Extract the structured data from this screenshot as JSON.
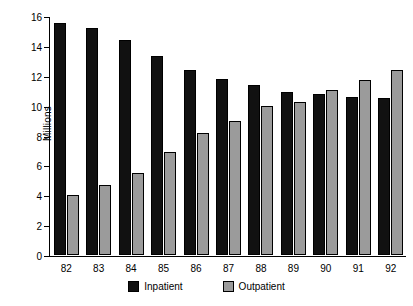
{
  "chart_data": {
    "type": "bar",
    "title": "",
    "xlabel": "",
    "ylabel": "Millions",
    "ylim": [
      0,
      16
    ],
    "yticks": [
      0,
      2,
      4,
      6,
      8,
      10,
      12,
      14,
      16
    ],
    "grid": false,
    "legend_position": "bottom",
    "categories": [
      "82",
      "83",
      "84",
      "85",
      "86",
      "87",
      "88",
      "89",
      "90",
      "91",
      "92"
    ],
    "series": [
      {
        "name": "Inpatient",
        "color": "#111111",
        "values": [
          15.5,
          15.2,
          14.4,
          13.3,
          12.4,
          11.8,
          11.4,
          10.9,
          10.8,
          10.6,
          10.5
        ]
      },
      {
        "name": "Outpatient",
        "color": "#9b9b9b",
        "values": [
          4.0,
          4.7,
          5.5,
          6.9,
          8.2,
          9.0,
          10.0,
          10.25,
          11.05,
          11.7,
          12.4
        ]
      }
    ]
  },
  "axes": {
    "y_title": "Millions",
    "y_tick_labels": [
      "0",
      "2",
      "4",
      "6",
      "8",
      "10",
      "12",
      "14",
      "16"
    ],
    "x_tick_labels": [
      "82",
      "83",
      "84",
      "85",
      "86",
      "87",
      "88",
      "89",
      "90",
      "91",
      "92"
    ]
  },
  "legend": {
    "entries": [
      {
        "label": "Inpatient",
        "swatch": "inpatient"
      },
      {
        "label": "Outpatient",
        "swatch": "outpatient"
      }
    ]
  },
  "colors": {
    "inpatient": "#111111",
    "outpatient": "#9b9b9b",
    "axis": "#000000",
    "background": "#ffffff"
  }
}
